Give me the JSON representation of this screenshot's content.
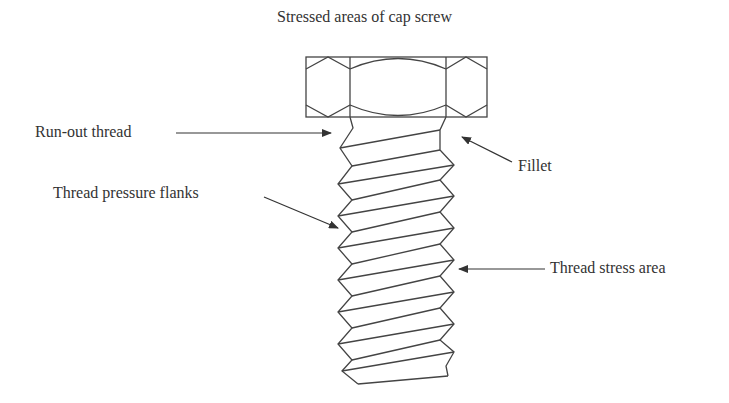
{
  "diagram": {
    "title": "Stressed areas of cap screw",
    "labels": {
      "run_out_thread": "Run-out thread",
      "thread_pressure_flanks": "Thread pressure flanks",
      "fillet": "Fillet",
      "thread_stress_area": "Thread stress area"
    },
    "line_color": "#444444",
    "text_color": "#333333"
  }
}
